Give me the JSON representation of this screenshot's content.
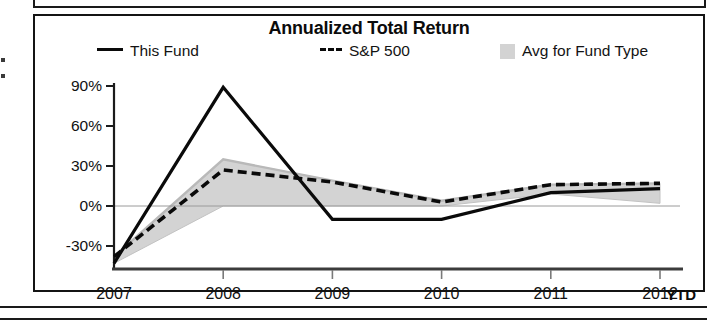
{
  "chart_card": {
    "title": "Annualized Total Return",
    "legend": [
      {
        "label": "This Fund",
        "marker": "solid-line-swatch"
      },
      {
        "label": "S&P 500",
        "marker": "dashed-line-swatch"
      },
      {
        "label": "Avg for Fund Type",
        "marker": "gray-band-swatch"
      }
    ],
    "axis": {
      "ytd_note": "YTD"
    }
  },
  "chart_data": {
    "type": "line",
    "title": "Annualized Total Return",
    "xlabel": "",
    "ylabel": "",
    "x": [
      "2007",
      "2008",
      "2009",
      "2010",
      "2011",
      "2012"
    ],
    "categories": [
      "2007",
      "2008",
      "2009",
      "2010",
      "2011",
      "2012"
    ],
    "ylim": [
      -45,
      95
    ],
    "yticks": [
      -30,
      0,
      30,
      60,
      90
    ],
    "ytick_labels": [
      "-30%",
      "0%",
      "30%",
      "60%",
      "90%"
    ],
    "xtick_labels": [
      "2007",
      "2008",
      "2009",
      "2010",
      "2011",
      "2012"
    ],
    "grid": false,
    "legend_position": "top",
    "annotations": [
      "YTD"
    ],
    "series": [
      {
        "name": "This Fund",
        "style": "solid",
        "color": "#0a0a0a",
        "values": [
          -43,
          89,
          -10,
          -10,
          10,
          13
        ]
      },
      {
        "name": "S&P 500",
        "style": "dashed",
        "color": "#0a0a0a",
        "values": [
          -38,
          27,
          18,
          3,
          16,
          17
        ]
      },
      {
        "name": "Avg for Fund Type",
        "style": "band",
        "color": "#d3d3d3",
        "band_upper": [
          -38,
          35,
          19,
          4,
          16,
          17
        ],
        "band_lower": [
          -43,
          0,
          0,
          0,
          9,
          2
        ],
        "values": [
          -40,
          32,
          14,
          2,
          13,
          9
        ]
      }
    ]
  }
}
